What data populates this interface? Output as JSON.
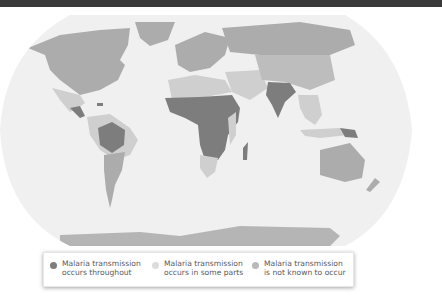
{
  "map": {
    "title": "",
    "projection": "robinson-like oval world map",
    "colors": {
      "ocean": "#f0f0f0",
      "throughout": "#7d7d7d",
      "some_parts": "#cfcfcf",
      "not_known": "#acacac",
      "topbar": "#3a3a3a"
    },
    "regions_throughout": [
      "Sub-Saharan Africa",
      "India",
      "Brazil (Amazon)",
      "Papua New Guinea",
      "Central America (parts)",
      "Haiti"
    ],
    "regions_some_parts": [
      "South America (northern)",
      "Mexico",
      "North Africa (Sahel fringe)",
      "Middle East",
      "Southeast Asia",
      "China (south)",
      "Southern Africa",
      "Madagascar"
    ],
    "regions_not_known": [
      "North America",
      "Europe",
      "Russia",
      "Australia",
      "Antarctica",
      "Southern South America",
      "Greenland"
    ]
  },
  "legend": {
    "items": [
      {
        "line1": "Malaria transmission",
        "line2": "occurs throughout",
        "color": "#7d7d7d"
      },
      {
        "line1": "Malaria transmission",
        "line2": "occurs in some parts",
        "color": "#dcdcdc"
      },
      {
        "line1": "Malaria transmission",
        "line2": "is not known to occur",
        "color": "#b9b9b9"
      }
    ]
  }
}
